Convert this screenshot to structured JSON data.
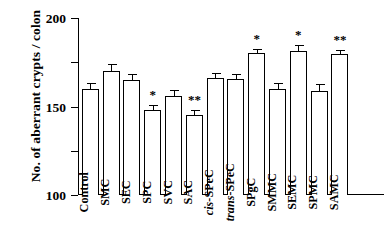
{
  "chart_data": {
    "type": "bar",
    "title": "",
    "xlabel": "",
    "ylabel": "No. of aberrant crypts / colon",
    "ylim": [
      0,
      200
    ],
    "yticks": [
      0,
      50,
      100,
      150,
      200
    ],
    "ytick_labels": [
      "0",
      "50",
      "100",
      "150",
      "200"
    ],
    "grid": false,
    "legend": null,
    "categories": [
      "Control",
      "SMC",
      "SEC",
      "SPC",
      "SVC",
      "SAC",
      "cis-SPeC",
      "trans-SPeC",
      "SPgC",
      "SMMC",
      "SEMC",
      "SPMC",
      "SAMC"
    ],
    "category_styles": [
      "normal",
      "normal",
      "normal",
      "normal",
      "normal",
      "normal",
      "italic-prefix",
      "italic-prefix",
      "normal",
      "normal",
      "normal",
      "normal",
      "normal"
    ],
    "values": [
      120,
      140,
      130,
      96,
      112,
      90,
      132,
      131,
      160,
      120,
      163,
      118,
      159
    ],
    "errors": [
      8,
      9,
      8,
      7,
      8,
      7,
      7,
      7,
      6,
      8,
      8,
      9,
      6
    ],
    "significance": [
      "",
      "",
      "",
      "*",
      "",
      "**",
      "",
      "",
      "*",
      "",
      "*",
      "",
      "**"
    ],
    "bar_fill": "#ffffff",
    "bar_edge": "#000000",
    "axis_color": "#000000"
  }
}
